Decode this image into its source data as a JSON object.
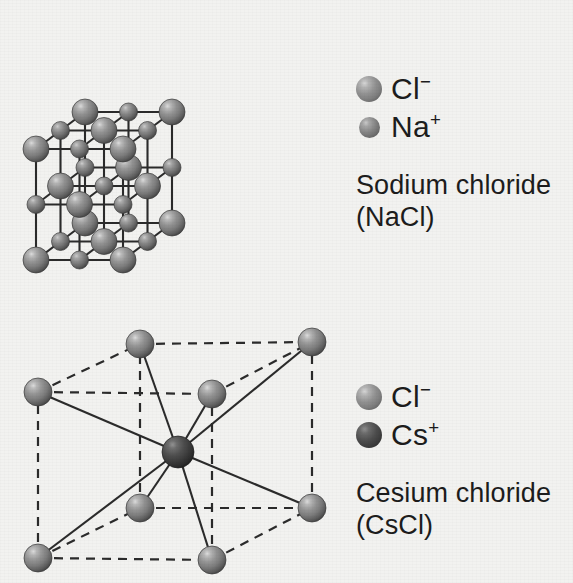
{
  "page": {
    "background_color": "#f2f2f0",
    "text_color": "#1c1c1c"
  },
  "colors": {
    "chloride": "#8a8a8a",
    "sodium": "#7d7d7d",
    "cesium": "#3f3f3f",
    "bond_line": "#2b2b2b"
  },
  "structures": [
    {
      "id": "sodium-chloride",
      "name": "Sodium chloride",
      "formula": "(NaCl)",
      "lattice_type": "face-centered-cubic-rock-salt",
      "grid": 3,
      "bond_style": "solid",
      "origin": {
        "x": 36,
        "y": 260
      },
      "step": {
        "x": 87,
        "y": 0
      },
      "up": {
        "x": 0,
        "y": -111
      },
      "depth": {
        "x": 49,
        "y": -37
      },
      "ions": [
        {
          "label": "Cl",
          "charge": "−",
          "radius": 13,
          "parity": 0,
          "fill": "chloride"
        },
        {
          "label": "Na",
          "charge": "+",
          "radius": 9,
          "parity": 1,
          "fill": "sodium"
        }
      ],
      "legend": [
        {
          "ion": "Cl",
          "charge": "−",
          "swatch": "cl",
          "size": "large"
        },
        {
          "ion": "Na",
          "charge": "+",
          "swatch": "na",
          "size": "small"
        }
      ]
    },
    {
      "id": "cesium-chloride",
      "name": "Cesium chloride",
      "formula": "(CsCl)",
      "lattice_type": "body-centered-cubic",
      "bond_style": "dashed-cell-solid-bonds",
      "corner_radius": 14,
      "center_radius": 16,
      "corners": [
        {
          "name": "front-bottom-left",
          "x": 38,
          "y": 558
        },
        {
          "name": "front-bottom-right",
          "x": 212,
          "y": 560
        },
        {
          "name": "front-top-left",
          "x": 38,
          "y": 392
        },
        {
          "name": "front-top-right",
          "x": 212,
          "y": 394
        },
        {
          "name": "back-bottom-left",
          "x": 140,
          "y": 508
        },
        {
          "name": "back-bottom-right",
          "x": 312,
          "y": 508
        },
        {
          "name": "back-top-left",
          "x": 140,
          "y": 344
        },
        {
          "name": "back-top-right",
          "x": 312,
          "y": 342
        }
      ],
      "center": {
        "name": "body-center-cesium",
        "x": 178,
        "y": 452
      },
      "legend": [
        {
          "ion": "Cl",
          "charge": "−",
          "swatch": "cl",
          "size": "large"
        },
        {
          "ion": "Cs",
          "charge": "+",
          "swatch": "cs",
          "size": "large"
        }
      ]
    }
  ],
  "labels": {
    "nacl_ion_1": "Cl",
    "nacl_ion_1_charge": "−",
    "nacl_ion_2": "Na",
    "nacl_ion_2_charge": "+",
    "nacl_name": "Sodium chloride",
    "nacl_formula": "(NaCl)",
    "cscl_ion_1": "Cl",
    "cscl_ion_1_charge": "−",
    "cscl_ion_2": "Cs",
    "cscl_ion_2_charge": "+",
    "cscl_name": "Cesium chloride",
    "cscl_formula": "(CsCl)"
  }
}
